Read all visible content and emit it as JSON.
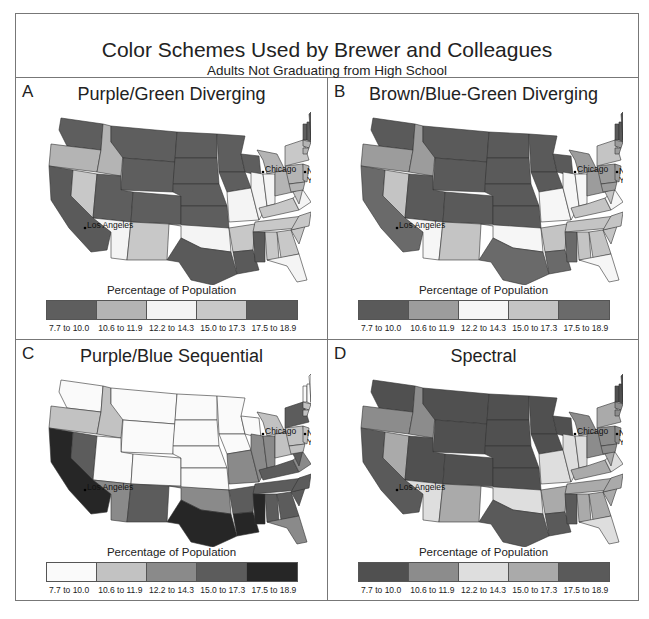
{
  "header": {
    "title": "Color Schemes Used by Brewer and Colleagues",
    "subtitle": "Adults Not Graduating from High School"
  },
  "legend_title": "Percentage of Population",
  "legend_labels": [
    "7.7 to 10.0",
    "10.6 to 11.9",
    "12.2 to 14.3",
    "15.0 to 17.3",
    "17.5 to 18.9"
  ],
  "cities": [
    "Chicago",
    "New York",
    "Los Angeles"
  ],
  "panels": [
    {
      "letter": "A",
      "title": "Purple/Green Diverging",
      "colors": [
        "#5e5e5e",
        "#b4b4b4",
        "#f4f4f4",
        "#c8c8c8",
        "#5a5a5a"
      ]
    },
    {
      "letter": "B",
      "title": "Brown/Blue-Green Diverging",
      "colors": [
        "#5a5a5a",
        "#9c9c9c",
        "#f6f6f6",
        "#c4c4c4",
        "#6a6a6a"
      ]
    },
    {
      "letter": "C",
      "title": "Purple/Blue Sequential",
      "colors": [
        "#fafafa",
        "#c2c2c2",
        "#8a8a8a",
        "#5c5c5c",
        "#262626"
      ]
    },
    {
      "letter": "D",
      "title": "Spectral",
      "colors": [
        "#505050",
        "#8c8c8c",
        "#dedede",
        "#aaaaaa",
        "#5a5a5a"
      ]
    }
  ],
  "chart_data": {
    "type": "choropleth",
    "title": "Color Schemes Used by Brewer and Colleagues",
    "subtitle": "Adults Not Graduating from High School",
    "legend_title": "Percentage of Population",
    "classes": [
      "7.7 to 10.0",
      "10.6 to 11.9",
      "12.2 to 14.3",
      "15.0 to 17.3",
      "17.5 to 18.9"
    ],
    "panels": [
      "A Purple/Green Diverging",
      "B Brown/Blue-Green Diverging",
      "C Purple/Blue Sequential",
      "D Spectral"
    ],
    "state_class": {
      "WA": 0,
      "OR": 1,
      "CA": 4,
      "NV": 3,
      "ID": 1,
      "MT": 0,
      "WY": 0,
      "UT": 0,
      "CO": 0,
      "AZ": 2,
      "NM": 3,
      "ND": 0,
      "SD": 0,
      "NE": 0,
      "KS": 0,
      "OK": 2,
      "TX": 4,
      "MN": 0,
      "IA": 0,
      "MO": 2,
      "AR": 3,
      "LA": 4,
      "WI": 0,
      "IL": 2,
      "MI": 1,
      "IN": 2,
      "OH": 1,
      "KY": 3,
      "TN": 3,
      "MS": 4,
      "AL": 3,
      "GA": 3,
      "FL": 2,
      "SC": 3,
      "NC": 3,
      "VA": 2,
      "WV": 3,
      "PA": 1,
      "NY": 3,
      "VT": 0,
      "NH": 0,
      "ME": 0,
      "MA": 1,
      "CT": 1,
      "NJ": 1,
      "MD": 1
    }
  }
}
